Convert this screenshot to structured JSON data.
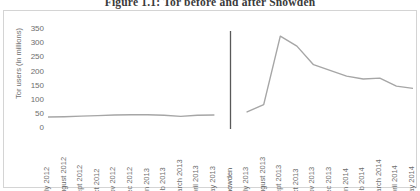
{
  "figure": {
    "title": "Figure 1.1: Tor before and after Snowden"
  },
  "chart_data": {
    "type": "line",
    "title": "Figure 1.1: Tor before and after Snowden",
    "xlabel": "",
    "ylabel": "Tor users (in millions)",
    "ylim": [
      0,
      350
    ],
    "yticks": [
      350,
      300,
      250,
      200,
      150,
      100,
      50,
      0
    ],
    "grid": false,
    "legend": "none",
    "line_color": "#a6a6a6",
    "event_line_color": "#595959",
    "categories": [
      "July 2012",
      "August 2012",
      "Sept 2012",
      "Oct 2012",
      "Nov 2012",
      "Dec 2012",
      "Jan 2013",
      "Feb 2013",
      "March 2013",
      "April 2013",
      "May 2013",
      "Snowden",
      "July 2013",
      "August 2013",
      "Sept 2013",
      "Oct 2013",
      "Nov 2013",
      "Dec 2013",
      "Jan 2014",
      "Feb 2014",
      "March 2014",
      "April 2014",
      "May 2014"
    ],
    "series": [
      {
        "name": "Tor users",
        "values": [
          42,
          43,
          45,
          47,
          49,
          50,
          50,
          48,
          44,
          48,
          49,
          null,
          60,
          85,
          325,
          290,
          225,
          205,
          185,
          175,
          178,
          150,
          142
        ]
      }
    ],
    "annotations": [
      {
        "label": "Snowden",
        "type": "vertical-line",
        "at_category": "Snowden"
      }
    ]
  }
}
